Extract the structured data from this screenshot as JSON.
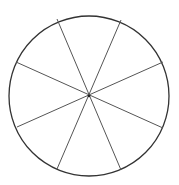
{
  "diagram": {
    "type": "circle-divided-into-sectors",
    "sector_count": 8,
    "circle": {
      "cx": 89,
      "cy": 96,
      "r": 80,
      "stroke": "#333333",
      "stroke_width": 1.3
    },
    "center_dot": {
      "cx": 89,
      "cy": 96,
      "r": 1.3,
      "fill": "#222222"
    },
    "spokes": [
      {
        "x1": 57,
        "y1": 19,
        "x2": 121,
        "y2": 170
      },
      {
        "x1": 121,
        "y1": 20,
        "x2": 57,
        "y2": 169
      },
      {
        "x1": 16,
        "y1": 62,
        "x2": 163,
        "y2": 128
      },
      {
        "x1": 163,
        "y1": 62,
        "x2": 17,
        "y2": 127
      }
    ],
    "spoke_color": "#555555"
  }
}
